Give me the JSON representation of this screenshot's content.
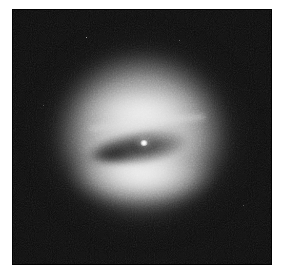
{
  "page": {
    "background_color": "#ffffff",
    "width": 284,
    "height": 277
  },
  "image_plate": {
    "name": "astronomical-observation",
    "subject": "galaxy with central dark dust disk",
    "background_color": "#050505",
    "left": 12,
    "top": 9,
    "width": 260,
    "height": 256,
    "caption": "",
    "labels": []
  },
  "features": {
    "halo": {
      "name": "bright elliptical halo",
      "center_x": 142,
      "center_y": 140,
      "width": 196,
      "height": 186,
      "peak_color": "#e8e8e8"
    },
    "dust_disk": {
      "name": "dark dust disk",
      "center_x": 148,
      "center_y": 138,
      "width": 134,
      "height": 52,
      "rotation_deg": -7,
      "core_color": "#1c1c1c"
    },
    "nucleus": {
      "name": "bright nucleus point source",
      "center_x": 144,
      "center_y": 143,
      "color": "#ffffff"
    }
  },
  "colors": {
    "sky": "#050505",
    "halo_peak": "#e8e8e8",
    "dust_dark": "#1c1c1c",
    "nucleus": "#ffffff",
    "page": "#ffffff"
  }
}
